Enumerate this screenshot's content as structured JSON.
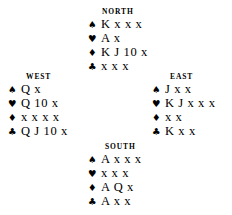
{
  "diagram": {
    "type": "bridge-hand-deal",
    "background_color": "#ffffff",
    "text_color": "#000000",
    "suit_symbols": {
      "spade": "♠",
      "heart": "♥",
      "diamond": "♦",
      "club": "♣"
    },
    "hands": {
      "north": {
        "label": "NORTH",
        "suits": [
          {
            "suit": "spade",
            "symbol": "♠",
            "cards": "K x x x"
          },
          {
            "suit": "heart",
            "symbol": "♥",
            "cards": "A x"
          },
          {
            "suit": "diamond",
            "symbol": "♦",
            "cards": "K J 10 x"
          },
          {
            "suit": "club",
            "symbol": "♣",
            "cards": "x x x"
          }
        ]
      },
      "west": {
        "label": "WEST",
        "suits": [
          {
            "suit": "spade",
            "symbol": "♠",
            "cards": "Q x"
          },
          {
            "suit": "heart",
            "symbol": "♥",
            "cards": "Q 10 x"
          },
          {
            "suit": "diamond",
            "symbol": "♦",
            "cards": "x x x x"
          },
          {
            "suit": "club",
            "symbol": "♣",
            "cards": "Q J 10 x"
          }
        ]
      },
      "east": {
        "label": "EAST",
        "suits": [
          {
            "suit": "spade",
            "symbol": "♠",
            "cards": "J x x"
          },
          {
            "suit": "heart",
            "symbol": "♥",
            "cards": "K J x x x"
          },
          {
            "suit": "diamond",
            "symbol": "♦",
            "cards": "x x"
          },
          {
            "suit": "club",
            "symbol": "♣",
            "cards": "K x x"
          }
        ]
      },
      "south": {
        "label": "SOUTH",
        "suits": [
          {
            "suit": "spade",
            "symbol": "♠",
            "cards": "A x x x"
          },
          {
            "suit": "heart",
            "symbol": "♥",
            "cards": "x x x"
          },
          {
            "suit": "diamond",
            "symbol": "♦",
            "cards": "A Q x"
          },
          {
            "suit": "club",
            "symbol": "♣",
            "cards": "A x x"
          }
        ]
      }
    }
  }
}
